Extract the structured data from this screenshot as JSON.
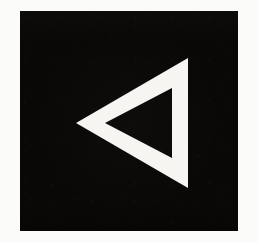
{
  "image": {
    "title": "Left-pointing hollow triangle",
    "description": "A white outlined triangle pointing left, centered on a solid black square plate over an off-white paper background.",
    "width": 258,
    "height": 243
  },
  "colors": {
    "page_background": "#fbfbf9",
    "plate_fill": "#0a0807",
    "glyph_stroke": "#f6f5f1",
    "hole_fill": "#0a0807"
  },
  "plate": {
    "name": "black-square-plate",
    "x": 20,
    "y": 11,
    "width": 218,
    "height": 220
  },
  "glyph": {
    "name": "triangle-left-outline",
    "direction": "left",
    "style": "outline",
    "stroke_width_px": 16,
    "outer_points": "56,112 168,47 168,177",
    "inner_points": "85,112 152,77 152,147",
    "outer_vertices": [
      {
        "label": "left-apex",
        "x": 56,
        "y": 112
      },
      {
        "label": "top-right",
        "x": 168,
        "y": 47
      },
      {
        "label": "bottom-right",
        "x": 168,
        "y": 177
      }
    ],
    "inner_vertices": [
      {
        "label": "inner-left-apex",
        "x": 85,
        "y": 112
      },
      {
        "label": "inner-top-right",
        "x": 152,
        "y": 77
      },
      {
        "label": "inner-bottom-right",
        "x": 152,
        "y": 147
      }
    ]
  }
}
